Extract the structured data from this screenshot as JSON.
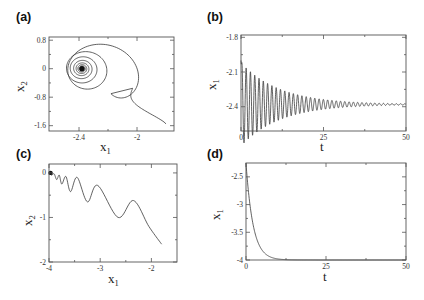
{
  "figure": {
    "panels": [
      {
        "id": "a",
        "label": "(a)"
      },
      {
        "id": "b",
        "label": "(b)"
      },
      {
        "id": "c",
        "label": "(c)"
      },
      {
        "id": "d",
        "label": "(d)"
      }
    ]
  },
  "chart_data": [
    {
      "panel": "(a)",
      "type": "line",
      "title": "",
      "xlabel": "x",
      "xlabel_sub": "1",
      "ylabel": "x",
      "ylabel_sub": "2",
      "xlim": [
        -2.607,
        -1.745
      ],
      "ylim": [
        -1.75,
        0.89
      ],
      "xticks": [
        -2.4,
        -2
      ],
      "xtick_labels": [
        "-2.4",
        "-2"
      ],
      "yticks": [
        0.8,
        0,
        -0.8,
        -1.6
      ],
      "ytick_labels": [
        "0.8",
        "0",
        "-0.8",
        "-1.6"
      ],
      "grid": false,
      "description": "Phase-plane spiral: trajectory enters from lower right (-1.8, -1.55), loops in decaying near-circular orbits converging to the fixed point (-2.38, 0)",
      "series": [
        {
          "name": "trajectory",
          "start": [
            -1.8,
            -1.55
          ],
          "center": [
            -2.38,
            0.0
          ],
          "initial_radius_x": 0.36,
          "initial_radius_y": 0.8,
          "decay": 0.8
        }
      ]
    },
    {
      "panel": "(b)",
      "type": "line",
      "title": "",
      "xlabel": "t",
      "xlabel_sub": "",
      "ylabel": "x",
      "ylabel_sub": "1",
      "xlim": [
        0,
        50
      ],
      "ylim": [
        -2.61,
        -1.78
      ],
      "xticks": [
        0,
        25,
        50
      ],
      "xtick_labels": [
        "0",
        "25",
        "50"
      ],
      "yticks": [
        -1.8,
        -2.1,
        -2.4
      ],
      "ytick_labels": [
        "-1.8",
        "-2.1",
        "-2.4"
      ],
      "grid": false,
      "description": "Damped oscillation of x1 vs t settling to about -2.38",
      "series": [
        {
          "name": "x1(t)",
          "equilibrium": -2.38,
          "amplitude": 0.36,
          "decay_rate": 0.085,
          "period": 1.3,
          "start": -2.0
        }
      ]
    },
    {
      "panel": "(c)",
      "type": "line",
      "title": "",
      "xlabel": "x",
      "xlabel_sub": "1",
      "ylabel": "x",
      "ylabel_sub": "2",
      "xlim": [
        -4,
        -1.5
      ],
      "ylim": [
        -2,
        0.2
      ],
      "xticks": [
        -4,
        -3,
        -2
      ],
      "xtick_labels": [
        "-4",
        "-3",
        "-2"
      ],
      "yticks": [
        0,
        -1,
        -2
      ],
      "ytick_labels": [
        "0",
        "-1",
        "-2"
      ],
      "grid": false,
      "description": "Scalloped trajectory from (-1.8, -1.6) moving left toward (-4, 0) with cusp peaks",
      "series": [
        {
          "name": "trajectory",
          "points": [
            [
              -1.8,
              -1.6
            ],
            [
              -2.05,
              -1.2
            ],
            [
              -2.35,
              -0.62
            ],
            [
              -2.65,
              -1.0
            ],
            [
              -3.05,
              -0.28
            ],
            [
              -3.25,
              -0.65
            ],
            [
              -3.45,
              -0.1
            ],
            [
              -3.58,
              -0.42
            ],
            [
              -3.67,
              -0.08
            ],
            [
              -3.75,
              -0.25
            ],
            [
              -3.8,
              -0.05
            ],
            [
              -3.85,
              -0.15
            ],
            [
              -3.9,
              -0.02
            ],
            [
              -3.95,
              -0.05
            ],
            [
              -4.0,
              0.0
            ]
          ]
        }
      ]
    },
    {
      "panel": "(d)",
      "type": "line",
      "title": "",
      "xlabel": "t",
      "xlabel_sub": "",
      "ylabel": "x",
      "ylabel_sub": "1",
      "xlim": [
        0,
        50
      ],
      "ylim": [
        -4,
        -2.25
      ],
      "xticks": [
        0,
        25,
        50
      ],
      "xtick_labels": [
        "0",
        "25",
        "50"
      ],
      "yticks": [
        -2.5,
        -3,
        -3.5,
        -4
      ],
      "ytick_labels": [
        "-2.5",
        "-3",
        "-3.5",
        "-4"
      ],
      "grid": false,
      "description": "Monotone exponential-like decay of x1 from about -2.25 to -4",
      "series": [
        {
          "name": "x1(t)",
          "start": -2.25,
          "end": -4.0,
          "tau": 2.2
        }
      ]
    }
  ]
}
